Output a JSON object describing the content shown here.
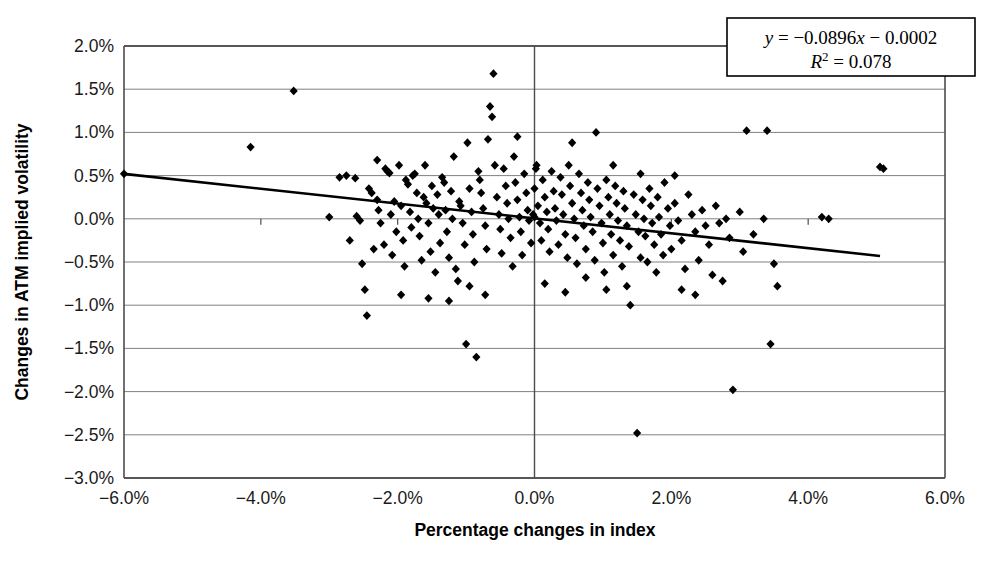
{
  "chart_data": {
    "type": "scatter",
    "title": "",
    "xlabel": "Percentage changes in index",
    "ylabel": "Changes in ATM implied volatility",
    "xlim": [
      -6.0,
      6.0
    ],
    "ylim": [
      -3.0,
      2.0
    ],
    "xticks": [
      -6.0,
      -4.0,
      -2.0,
      0.0,
      2.0,
      4.0,
      6.0
    ],
    "yticks": [
      2.0,
      1.5,
      1.0,
      0.5,
      0.0,
      -0.5,
      -1.0,
      -1.5,
      -2.0,
      -2.5,
      -3.0
    ],
    "xtick_labels": [
      "-6.0%",
      "-4.0%",
      "-2.0%",
      "0.0%",
      "2.0%",
      "4.0%",
      "6.0%"
    ],
    "ytick_labels": [
      "2.0%",
      "1.5%",
      "1.0%",
      "0.5%",
      "0.0%",
      "-0.5%",
      "-1.0%",
      "-1.5%",
      "-2.0%",
      "-2.5%",
      "-3.0%"
    ],
    "grid": "horizontal",
    "legend": "none",
    "marker": "diamond",
    "marker_color": "#000000",
    "gridline_color": "#808080",
    "axis_color": "#4d4d4d",
    "trendline": {
      "slope": -0.0896,
      "intercept": -0.0002,
      "r_squared": 0.078,
      "equation_line1": "y = -0.0896x - 0.0002",
      "equation_line2": "R2 = 0.078",
      "x_start": -6.0,
      "y_start": 0.52,
      "x_end": 5.05,
      "y_end": -0.43,
      "color": "#000000"
    },
    "points": [
      [
        -6.0,
        0.52
      ],
      [
        -4.15,
        0.83
      ],
      [
        -3.52,
        1.48
      ],
      [
        -3.0,
        0.02
      ],
      [
        -2.75,
        0.5
      ],
      [
        -2.62,
        0.47
      ],
      [
        -2.6,
        0.03
      ],
      [
        -2.55,
        -0.02
      ],
      [
        -2.52,
        -0.52
      ],
      [
        -2.48,
        -0.82
      ],
      [
        -2.45,
        -1.12
      ],
      [
        -2.42,
        0.35
      ],
      [
        -2.38,
        0.3
      ],
      [
        -2.35,
        -0.35
      ],
      [
        -2.3,
        0.22
      ],
      [
        -2.28,
        0.1
      ],
      [
        -2.25,
        -0.05
      ],
      [
        -2.2,
        -0.3
      ],
      [
        -2.18,
        0.58
      ],
      [
        -2.15,
        0.55
      ],
      [
        -2.12,
        0.53
      ],
      [
        -2.1,
        0.05
      ],
      [
        -2.08,
        -0.42
      ],
      [
        -2.05,
        0.2
      ],
      [
        -2.02,
        -0.15
      ],
      [
        -1.98,
        0.62
      ],
      [
        -1.95,
        0.15
      ],
      [
        -1.92,
        -0.25
      ],
      [
        -1.9,
        -0.55
      ],
      [
        -1.88,
        0.45
      ],
      [
        -1.85,
        0.4
      ],
      [
        -1.82,
        0.08
      ],
      [
        -1.8,
        -0.1
      ],
      [
        -1.78,
        0.5
      ],
      [
        -1.75,
        0.52
      ],
      [
        -1.72,
        0.3
      ],
      [
        -1.7,
        0.0
      ],
      [
        -1.68,
        -0.2
      ],
      [
        -1.65,
        -0.48
      ],
      [
        -1.62,
        0.25
      ],
      [
        -1.6,
        0.62
      ],
      [
        -1.58,
        0.18
      ],
      [
        -1.55,
        -0.05
      ],
      [
        -1.52,
        -0.38
      ],
      [
        -1.5,
        0.38
      ],
      [
        -1.48,
        0.12
      ],
      [
        -1.45,
        -0.62
      ],
      [
        -1.42,
        0.28
      ],
      [
        -1.4,
        0.05
      ],
      [
        -1.38,
        -0.28
      ],
      [
        -1.35,
        0.48
      ],
      [
        -1.32,
        0.42
      ],
      [
        -1.3,
        0.1
      ],
      [
        -1.28,
        -0.15
      ],
      [
        -1.25,
        -0.45
      ],
      [
        -1.22,
        0.32
      ],
      [
        -1.2,
        0.0
      ],
      [
        -1.18,
        0.72
      ],
      [
        -1.15,
        -0.58
      ],
      [
        -1.12,
        -0.72
      ],
      [
        -1.1,
        0.2
      ],
      [
        -1.08,
        0.15
      ],
      [
        -1.05,
        -0.05
      ],
      [
        -1.02,
        -0.3
      ],
      [
        -1.0,
        -1.45
      ],
      [
        -0.98,
        0.88
      ],
      [
        -0.95,
        0.35
      ],
      [
        -0.92,
        0.08
      ],
      [
        -0.9,
        -0.18
      ],
      [
        -0.88,
        -0.5
      ],
      [
        -0.85,
        -1.6
      ],
      [
        -0.82,
        0.55
      ],
      [
        -0.8,
        0.45
      ],
      [
        -0.78,
        0.3
      ],
      [
        -0.75,
        0.12
      ],
      [
        -0.72,
        -0.08
      ],
      [
        -0.7,
        -0.35
      ],
      [
        -0.68,
        0.92
      ],
      [
        -0.65,
        1.3
      ],
      [
        -0.62,
        1.18
      ],
      [
        -0.6,
        1.68
      ],
      [
        -0.58,
        0.62
      ],
      [
        -0.55,
        0.25
      ],
      [
        -0.52,
        0.05
      ],
      [
        -0.5,
        -0.12
      ],
      [
        -0.48,
        -0.4
      ],
      [
        -0.45,
        0.58
      ],
      [
        -0.42,
        0.38
      ],
      [
        -0.4,
        0.18
      ],
      [
        -0.38,
        0.0
      ],
      [
        -0.35,
        -0.22
      ],
      [
        -0.32,
        -0.55
      ],
      [
        -0.3,
        0.72
      ],
      [
        -0.28,
        0.42
      ],
      [
        -0.25,
        0.22
      ],
      [
        -0.22,
        0.02
      ],
      [
        -0.2,
        -0.15
      ],
      [
        -0.18,
        -0.42
      ],
      [
        -0.15,
        0.52
      ],
      [
        -0.12,
        0.3
      ],
      [
        -0.1,
        0.1
      ],
      [
        -0.08,
        -0.02
      ],
      [
        -0.05,
        -0.28
      ],
      [
        -0.02,
        0.05
      ],
      [
        0.0,
        0.02
      ],
      [
        0.0,
        0.35
      ],
      [
        0.02,
        0.58
      ],
      [
        0.03,
        0.62
      ],
      [
        0.05,
        0.15
      ],
      [
        0.08,
        -0.05
      ],
      [
        0.1,
        -0.25
      ],
      [
        0.12,
        0.45
      ],
      [
        0.15,
        0.25
      ],
      [
        0.18,
        0.08
      ],
      [
        0.2,
        -0.12
      ],
      [
        0.22,
        -0.38
      ],
      [
        0.25,
        0.55
      ],
      [
        0.28,
        0.32
      ],
      [
        0.3,
        0.12
      ],
      [
        0.32,
        -0.02
      ],
      [
        0.35,
        -0.3
      ],
      [
        0.38,
        0.48
      ],
      [
        0.4,
        0.28
      ],
      [
        0.42,
        0.05
      ],
      [
        0.45,
        -0.18
      ],
      [
        0.48,
        -0.45
      ],
      [
        0.5,
        0.62
      ],
      [
        0.52,
        0.38
      ],
      [
        0.55,
        0.18
      ],
      [
        0.58,
        0.0
      ],
      [
        0.6,
        -0.22
      ],
      [
        0.62,
        -0.52
      ],
      [
        0.65,
        0.52
      ],
      [
        0.68,
        0.3
      ],
      [
        0.7,
        0.1
      ],
      [
        0.72,
        -0.08
      ],
      [
        0.75,
        -0.35
      ],
      [
        0.78,
        0.42
      ],
      [
        0.8,
        0.22
      ],
      [
        0.82,
        0.02
      ],
      [
        0.85,
        -0.15
      ],
      [
        0.88,
        -0.48
      ],
      [
        0.9,
        1.0
      ],
      [
        0.92,
        0.35
      ],
      [
        0.95,
        0.15
      ],
      [
        0.98,
        -0.05
      ],
      [
        1.0,
        -0.28
      ],
      [
        1.02,
        -0.62
      ],
      [
        1.05,
        0.45
      ],
      [
        1.08,
        0.25
      ],
      [
        1.1,
        0.05
      ],
      [
        1.12,
        -0.18
      ],
      [
        1.15,
        -0.42
      ],
      [
        1.18,
        0.38
      ],
      [
        1.2,
        0.18
      ],
      [
        1.22,
        -0.02
      ],
      [
        1.25,
        -0.25
      ],
      [
        1.28,
        -0.55
      ],
      [
        1.3,
        0.32
      ],
      [
        1.32,
        0.12
      ],
      [
        1.35,
        -0.08
      ],
      [
        1.38,
        -0.32
      ],
      [
        1.4,
        -1.0
      ],
      [
        1.45,
        0.28
      ],
      [
        1.48,
        0.05
      ],
      [
        1.5,
        -2.48
      ],
      [
        1.52,
        -0.15
      ],
      [
        1.55,
        -0.45
      ],
      [
        1.58,
        0.22
      ],
      [
        1.6,
        0.0
      ],
      [
        1.62,
        -0.2
      ],
      [
        1.65,
        -0.5
      ],
      [
        1.68,
        0.35
      ],
      [
        1.7,
        0.15
      ],
      [
        1.72,
        -0.05
      ],
      [
        1.75,
        -0.3
      ],
      [
        1.78,
        -0.62
      ],
      [
        1.8,
        0.25
      ],
      [
        1.82,
        0.02
      ],
      [
        1.85,
        -0.18
      ],
      [
        1.88,
        -0.42
      ],
      [
        1.9,
        0.42
      ],
      [
        1.95,
        0.12
      ],
      [
        1.98,
        -0.08
      ],
      [
        2.0,
        -0.35
      ],
      [
        2.05,
        0.18
      ],
      [
        2.1,
        -0.02
      ],
      [
        2.15,
        -0.25
      ],
      [
        2.2,
        -0.58
      ],
      [
        2.25,
        0.28
      ],
      [
        2.3,
        0.05
      ],
      [
        2.35,
        -0.15
      ],
      [
        2.4,
        -0.48
      ],
      [
        2.45,
        0.1
      ],
      [
        2.5,
        -0.08
      ],
      [
        2.55,
        -0.3
      ],
      [
        2.6,
        -0.65
      ],
      [
        2.65,
        0.15
      ],
      [
        2.7,
        -0.05
      ],
      [
        2.75,
        -0.72
      ],
      [
        2.8,
        0.0
      ],
      [
        2.85,
        -0.22
      ],
      [
        2.9,
        -1.98
      ],
      [
        3.0,
        0.08
      ],
      [
        3.05,
        -0.38
      ],
      [
        3.1,
        1.02
      ],
      [
        3.2,
        -0.18
      ],
      [
        3.35,
        0.0
      ],
      [
        3.4,
        1.02
      ],
      [
        3.45,
        -1.45
      ],
      [
        3.5,
        -0.52
      ],
      [
        3.55,
        -0.78
      ],
      [
        4.2,
        0.02
      ],
      [
        4.3,
        0.0
      ],
      [
        5.05,
        0.6
      ],
      [
        5.1,
        0.58
      ],
      [
        -2.85,
        0.48
      ],
      [
        -2.7,
        -0.25
      ],
      [
        -1.95,
        -0.88
      ],
      [
        -1.55,
        -0.92
      ],
      [
        -1.25,
        -0.95
      ],
      [
        -0.95,
        -0.78
      ],
      [
        -0.72,
        -0.88
      ],
      [
        0.15,
        -0.75
      ],
      [
        0.45,
        -0.85
      ],
      [
        0.75,
        -0.68
      ],
      [
        1.05,
        -0.82
      ],
      [
        1.35,
        -0.78
      ],
      [
        2.15,
        -0.82
      ],
      [
        2.35,
        -0.88
      ],
      [
        -2.3,
        0.68
      ],
      [
        -0.25,
        0.95
      ],
      [
        0.55,
        0.88
      ],
      [
        1.15,
        0.62
      ],
      [
        1.55,
        0.52
      ],
      [
        2.05,
        0.5
      ]
    ]
  }
}
